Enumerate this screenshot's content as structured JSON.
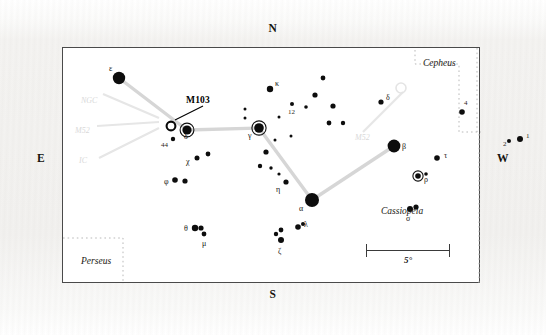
{
  "figure": {
    "frame_border_color": "#4a4a4a",
    "background_color": "#ffffff",
    "paper_color": "#f2f1ef"
  },
  "compass": {
    "north": "N",
    "south": "S",
    "east": "E",
    "west": "W"
  },
  "scale": {
    "label": "5°",
    "length_px": 84
  },
  "callout": {
    "label": "M103"
  },
  "regions": [
    {
      "name": "Cepheus",
      "x": 360,
      "y": 10,
      "align": "left"
    },
    {
      "name": "Cassiopeia",
      "x": 318,
      "y": 158,
      "align": "left"
    },
    {
      "name": "Perseus",
      "x": 18,
      "y": 208,
      "align": "left"
    }
  ],
  "watermarks": [
    {
      "text": "M52",
      "x": 292,
      "y": 85
    },
    {
      "text": "NGC",
      "x": 18,
      "y": 48
    },
    {
      "text": "M52",
      "x": 12,
      "y": 78
    },
    {
      "text": "IC",
      "x": 16,
      "y": 108
    }
  ],
  "chart_data": {
    "type": "scatter",
    "title": "Cassiopeia",
    "xlabel": "",
    "ylabel": "",
    "grid": false,
    "legend": "none",
    "note": "Star chart of the constellation Cassiopeia with the open cluster M103 marked. Marker radius encodes apparent magnitude (larger = brighter).",
    "stars": [
      {
        "id": "eps",
        "label": "ε",
        "x": 56,
        "y": 30,
        "r": 6.2,
        "ring": false,
        "label_dx": -10,
        "label_dy": -9
      },
      {
        "id": "del",
        "label": "δ",
        "x": 124,
        "y": 82,
        "r": 4.6,
        "ring": true,
        "label_dx": -3,
        "label_dy": 7
      },
      {
        "id": "gam",
        "label": "γ",
        "x": 196,
        "y": 80,
        "r": 4.8,
        "ring": true,
        "label_dx": -11,
        "label_dy": 8
      },
      {
        "id": "alp",
        "label": "α",
        "x": 249,
        "y": 152,
        "r": 7.0,
        "ring": false,
        "label_dx": -13,
        "label_dy": 9
      },
      {
        "id": "bet",
        "label": "β",
        "x": 331,
        "y": 98,
        "r": 6.4,
        "ring": false,
        "label_dx": 8,
        "label_dy": 1
      },
      {
        "id": "kap",
        "label": "κ",
        "x": 207,
        "y": 41,
        "r": 3.2,
        "ring": false,
        "label_dx": 5,
        "label_dy": -5
      },
      {
        "id": "chi",
        "label": "χ",
        "x": 134,
        "y": 110,
        "r": 2.5,
        "ring": false,
        "label_dx": -11,
        "label_dy": 4
      },
      {
        "id": "phi",
        "label": "φ",
        "x": 112,
        "y": 132,
        "r": 2.8,
        "ring": false,
        "label_dx": -11,
        "label_dy": 2
      },
      {
        "id": "eta",
        "label": "η",
        "x": 223,
        "y": 134,
        "r": 2.6,
        "ring": false,
        "label_dx": -10,
        "label_dy": 8
      },
      {
        "id": "tht",
        "label": "θ",
        "x": 132,
        "y": 180,
        "r": 3.2,
        "ring": false,
        "label_dx": -11,
        "label_dy": 1
      },
      {
        "id": "mu",
        "label": "μ",
        "x": 141,
        "y": 186,
        "r": 2.4,
        "ring": false,
        "label_dx": -2,
        "label_dy": 10
      },
      {
        "id": "lam",
        "label": "λ",
        "x": 235,
        "y": 179,
        "r": 2.8,
        "ring": false,
        "label_dx": 6,
        "label_dy": -2
      },
      {
        "id": "zet",
        "label": "ζ",
        "x": 218,
        "y": 192,
        "r": 3.0,
        "ring": false,
        "label_dx": -3,
        "label_dy": 12
      },
      {
        "id": "zet2",
        "label": "",
        "x": 213,
        "y": 186,
        "r": 2.2,
        "ring": false,
        "label_dx": 0,
        "label_dy": 0
      },
      {
        "id": "rho",
        "label": "ρ",
        "x": 355,
        "y": 128,
        "r": 2.8,
        "ring": true,
        "label_dx": 6,
        "label_dy": 4
      },
      {
        "id": "tau",
        "label": "τ",
        "x": 374,
        "y": 110,
        "r": 2.8,
        "ring": false,
        "label_dx": 7,
        "label_dy": -2
      },
      {
        "id": "sig",
        "label": "σ",
        "x": 347,
        "y": 161,
        "r": 3.0,
        "ring": false,
        "label_dx": -4,
        "label_dy": 10
      },
      {
        "id": "sig2",
        "label": "",
        "x": 353,
        "y": 159,
        "r": 2.6,
        "ring": false,
        "label_dx": 0,
        "label_dy": 0
      },
      {
        "id": "n44",
        "label": "44",
        "x": 110,
        "y": 91,
        "r": 2.2,
        "ring": false,
        "label_dx": -12,
        "label_dy": 7
      },
      {
        "id": "n12",
        "label": "12",
        "x": 229,
        "y": 56,
        "r": 2.0,
        "ring": false,
        "label_dx": -4,
        "label_dy": 9
      },
      {
        "id": "ndel",
        "label": "δ",
        "x": 318,
        "y": 54,
        "r": 2.6,
        "ring": false,
        "label_dx": 5,
        "label_dy": -4
      },
      {
        "id": "n4",
        "label": "4",
        "x": 399,
        "y": 64,
        "r": 2.8,
        "ring": false,
        "label_dx": 2,
        "label_dy": -8
      },
      {
        "id": "n1",
        "label": "1",
        "x": 457,
        "y": 91,
        "r": 3.0,
        "ring": false,
        "label_dx": 6,
        "label_dy": -2
      },
      {
        "id": "n2",
        "label": "2",
        "x": 446,
        "y": 93,
        "r": 2.0,
        "ring": false,
        "label_dx": -6,
        "label_dy": 4
      },
      {
        "id": "f1",
        "label": "",
        "x": 182,
        "y": 61,
        "r": 1.5,
        "ring": false
      },
      {
        "id": "f2",
        "label": "",
        "x": 182,
        "y": 70,
        "r": 1.5,
        "ring": false
      },
      {
        "id": "f3",
        "label": "",
        "x": 212,
        "y": 92,
        "r": 1.5,
        "ring": false
      },
      {
        "id": "f4",
        "label": "",
        "x": 228,
        "y": 88,
        "r": 1.5,
        "ring": false
      },
      {
        "id": "f5",
        "label": "",
        "x": 203,
        "y": 104,
        "r": 2.6,
        "ring": false
      },
      {
        "id": "f6",
        "label": "",
        "x": 197,
        "y": 118,
        "r": 2.2,
        "ring": false
      },
      {
        "id": "f7",
        "label": "",
        "x": 208,
        "y": 120,
        "r": 1.7,
        "ring": false
      },
      {
        "id": "f8",
        "label": "",
        "x": 260,
        "y": 30,
        "r": 2.4,
        "ring": false
      },
      {
        "id": "f9",
        "label": "",
        "x": 270,
        "y": 58,
        "r": 2.6,
        "ring": false
      },
      {
        "id": "f10",
        "label": "",
        "x": 252,
        "y": 47,
        "r": 2.6,
        "ring": false
      },
      {
        "id": "f11",
        "label": "",
        "x": 266,
        "y": 75,
        "r": 2.4,
        "ring": false
      },
      {
        "id": "f12",
        "label": "",
        "x": 280,
        "y": 75,
        "r": 2.2,
        "ring": false
      },
      {
        "id": "f13",
        "label": "",
        "x": 243,
        "y": 59,
        "r": 1.8,
        "ring": false
      },
      {
        "id": "f14",
        "label": "",
        "x": 216,
        "y": 69,
        "r": 1.5,
        "ring": false
      },
      {
        "id": "f15",
        "label": "",
        "x": 363,
        "y": 126,
        "r": 1.8,
        "ring": false
      },
      {
        "id": "f16",
        "label": "",
        "x": 240,
        "y": 176,
        "r": 2.0,
        "ring": false
      },
      {
        "id": "f17",
        "label": "",
        "x": 218,
        "y": 182,
        "r": 2.4,
        "ring": false
      },
      {
        "id": "f18",
        "label": "",
        "x": 216,
        "y": 126,
        "r": 1.6,
        "ring": false
      },
      {
        "id": "f19",
        "label": "",
        "x": 145,
        "y": 106,
        "r": 2.4,
        "ring": false
      },
      {
        "id": "f20",
        "label": "",
        "x": 122,
        "y": 133,
        "r": 2.6,
        "ring": false
      },
      {
        "id": "f21",
        "label": "",
        "x": 138,
        "y": 180,
        "r": 2.6,
        "ring": false
      }
    ],
    "cluster": {
      "id": "m103",
      "label": "M103",
      "x": 108,
      "y": 78,
      "r": 4.4,
      "open": true
    },
    "constellation_lines": [
      {
        "from": "eps",
        "to": "del"
      },
      {
        "from": "del",
        "to": "gam"
      },
      {
        "from": "gam",
        "to": "alp"
      },
      {
        "from": "alp",
        "to": "bet"
      }
    ],
    "boundaries": [
      {
        "name": "cepheus-box"
      },
      {
        "name": "perseus-box"
      },
      {
        "name": "east-edge-dots"
      }
    ]
  }
}
